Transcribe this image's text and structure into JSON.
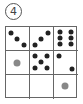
{
  "label": "4",
  "colors": {
    "dot": "#222222",
    "gray_dot": "#888888",
    "line": "#666666"
  },
  "grid": {
    "rows": 3,
    "cols": 3,
    "cells": [
      {
        "row": 0,
        "col": 0,
        "type": "dots",
        "count": 3,
        "pattern": "diagonal-down"
      },
      {
        "row": 0,
        "col": 1,
        "type": "dots",
        "count": 3,
        "pattern": "diagonal-up"
      },
      {
        "row": 0,
        "col": 2,
        "type": "dots",
        "count": 6,
        "pattern": "two-columns"
      },
      {
        "row": 1,
        "col": 0,
        "type": "gray-dot",
        "count": 1
      },
      {
        "row": 1,
        "col": 1,
        "type": "dots",
        "count": 5,
        "pattern": "quincunx"
      },
      {
        "row": 1,
        "col": 2,
        "type": "dots",
        "count": 2,
        "pattern": "diagonal-down"
      },
      {
        "row": 2,
        "col": 0,
        "type": "empty",
        "count": 0
      },
      {
        "row": 2,
        "col": 1,
        "type": "empty",
        "count": 0
      },
      {
        "row": 2,
        "col": 2,
        "type": "gray-dot",
        "count": 1
      }
    ]
  }
}
